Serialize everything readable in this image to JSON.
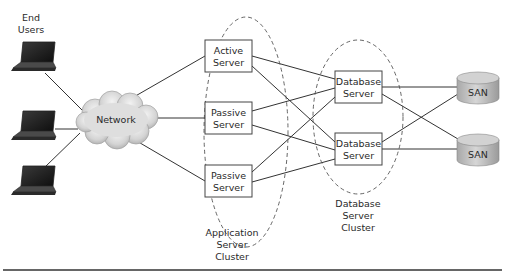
{
  "diagram": {
    "type": "network-architecture",
    "end_users": {
      "label_line1": "End",
      "label_line2": "Users",
      "devices": [
        "laptop",
        "laptop",
        "laptop"
      ]
    },
    "network": {
      "label": "Network",
      "icon": "cloud-icon"
    },
    "app_cluster": {
      "label_line1": "Application",
      "label_line2": "Server",
      "label_line3": "Cluster",
      "servers": [
        {
          "line1": "Active",
          "line2": "Server"
        },
        {
          "line1": "Passive",
          "line2": "Server"
        },
        {
          "line1": "Passive",
          "line2": "Server"
        }
      ]
    },
    "db_cluster": {
      "label_line1": "Database",
      "label_line2": "Server",
      "label_line3": "Cluster",
      "servers": [
        {
          "line1": "Database",
          "line2": "Server"
        },
        {
          "line1": "Database",
          "line2": "Server"
        }
      ]
    },
    "storage": [
      {
        "label": "SAN",
        "icon": "disk-cylinder-icon"
      },
      {
        "label": "SAN",
        "icon": "disk-cylinder-icon"
      }
    ],
    "connections": [
      [
        "laptop-1",
        "network"
      ],
      [
        "laptop-2",
        "network"
      ],
      [
        "laptop-3",
        "network"
      ],
      [
        "network",
        "active-server"
      ],
      [
        "network",
        "passive-server-1"
      ],
      [
        "network",
        "passive-server-2"
      ],
      [
        "active-server",
        "database-server-1"
      ],
      [
        "active-server",
        "database-server-2"
      ],
      [
        "passive-server-1",
        "database-server-1"
      ],
      [
        "passive-server-1",
        "database-server-2"
      ],
      [
        "passive-server-2",
        "database-server-1"
      ],
      [
        "passive-server-2",
        "database-server-2"
      ],
      [
        "database-server-1",
        "san-1"
      ],
      [
        "database-server-1",
        "san-2"
      ],
      [
        "database-server-2",
        "san-1"
      ],
      [
        "database-server-2",
        "san-2"
      ]
    ]
  }
}
